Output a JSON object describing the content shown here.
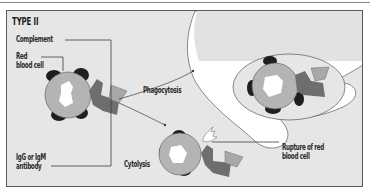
{
  "figure": {
    "title": "TYPE II",
    "labels": {
      "complement": "Complement",
      "red_blood_cell_line1": "Red",
      "red_blood_cell_line2": "blood cell",
      "antibody_line1": "IgG or IgM",
      "antibody_line2": "antibody",
      "phagocytosis": "Phagocytosis",
      "cytolysis": "Cytolysis",
      "rupture_line1": "Rupture of red",
      "rupture_line2": "blood cell"
    },
    "colors": {
      "background": "#e6e6e6",
      "frame_border": "#5a5a5a",
      "cell_body": "#b4b4b4",
      "cell_nucleus": "#ffffff",
      "complement_dark": "#1e1e1e",
      "antibody": "#6e6e6e",
      "antigen": "#a8a8a8",
      "phagocyte": "#ffffff",
      "line": "#3c3c3c"
    },
    "nodes": [
      {
        "id": "rbc-initial",
        "label": "Red blood cell with complement and antibody"
      },
      {
        "id": "phagocyte",
        "label": "Phagocyte engulfing red blood cell"
      },
      {
        "id": "rbc-lysed",
        "label": "Ruptured red blood cell"
      }
    ],
    "edges": [
      {
        "from": "rbc-initial",
        "to": "phagocyte",
        "label": "Phagocytosis"
      },
      {
        "from": "rbc-initial",
        "to": "rbc-lysed",
        "label": "Cytolysis"
      }
    ]
  }
}
